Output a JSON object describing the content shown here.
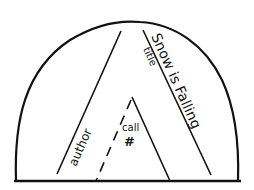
{
  "diagram": {
    "type": "spine-label-layout",
    "labels": {
      "author": "author",
      "title_label": "title",
      "title_value": "Snow is Falling",
      "call_line1": "call",
      "call_line2": "#"
    },
    "colors": {
      "stroke": "#111111",
      "background": "#ffffff"
    }
  }
}
